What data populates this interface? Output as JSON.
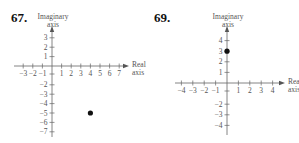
{
  "problems": [
    {
      "number": "67."
    },
    {
      "number": "69."
    }
  ],
  "chart_data": [
    {
      "type": "scatter",
      "title": "67.",
      "xlabel": "Real axis",
      "ylabel": "Imaginary axis",
      "x_ticks": [
        -3,
        -2,
        -1,
        1,
        2,
        3,
        4,
        5,
        6,
        7
      ],
      "y_ticks": [
        3,
        2,
        1,
        -2,
        -3,
        -4,
        -5,
        -6,
        -7
      ],
      "xlim": [
        -3,
        7
      ],
      "ylim": [
        -7,
        3
      ],
      "grid": false,
      "points": [
        {
          "x": 4,
          "y": -5
        }
      ]
    },
    {
      "type": "scatter",
      "title": "69.",
      "xlabel": "Real axis",
      "ylabel": "Imaginary axis",
      "x_ticks": [
        -4,
        -3,
        -2,
        -1,
        1,
        2,
        3,
        4
      ],
      "y_ticks": [
        4,
        3,
        2,
        1,
        -2,
        -3,
        -4
      ],
      "xlim": [
        -4,
        4
      ],
      "ylim": [
        -4,
        4
      ],
      "grid": false,
      "points": [
        {
          "x": 0,
          "y": 3
        }
      ]
    }
  ],
  "labels": {
    "imag_line1": "Imaginary",
    "imag_line2": "axis",
    "real_line1": "Real",
    "real_line2": "axis"
  }
}
